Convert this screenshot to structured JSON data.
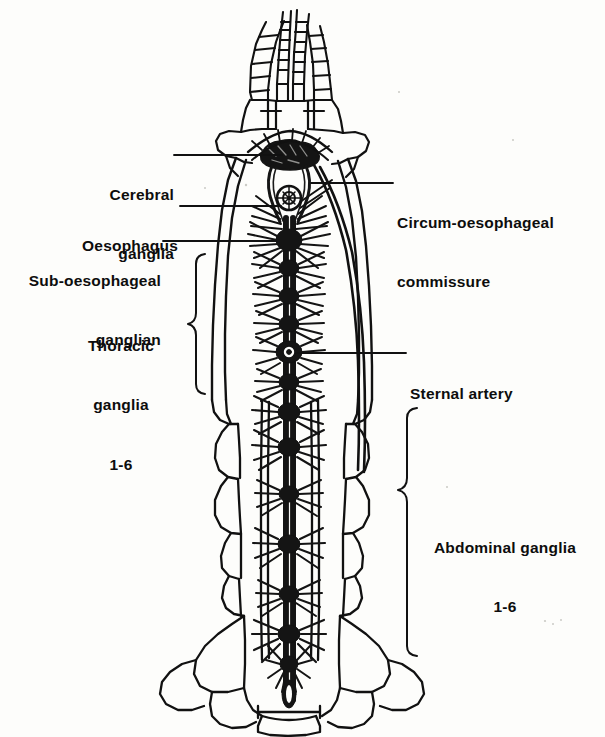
{
  "figure": {
    "kind": "anatomical-diagram",
    "background_color": "#fdfdfb",
    "ink_color": "#111111"
  },
  "labels": {
    "cerebral_ganglia": {
      "line1": "Cerebral",
      "line2": "ganglia"
    },
    "oesophagus": {
      "line1": "Oesophagus"
    },
    "sub_oesophageal_ganglian": {
      "line1": "Sub-oesophageal",
      "line2": "ganglian"
    },
    "thoracic_ganglia": {
      "line1": "Thoracic",
      "line2": "ganglia",
      "line3": "1-6"
    },
    "circum_oesophageal_commissure": {
      "line1": "Circum-oesophageal",
      "line2": "commissure"
    },
    "sternal_artery": {
      "line1": "Sternal artery"
    },
    "abdominal_ganglia": {
      "line1": "Abdominal ganglia",
      "line2": "1-6"
    }
  },
  "anatomy": {
    "structures": [
      "antennules",
      "antennae",
      "cerebral-ganglia-mass",
      "circum-oesophageal-commissure",
      "oesophagus-ring",
      "sub-oesophageal-ganglion",
      "ventral-nerve-cord",
      "thoracic-ganglia-chain",
      "sternal-artery-foramen",
      "abdominal-ganglia-chain",
      "abdominal-segment-plates",
      "telson",
      "uropods"
    ],
    "thoracic_ganglia_count": 6,
    "abdominal_ganglia_count": 6
  }
}
